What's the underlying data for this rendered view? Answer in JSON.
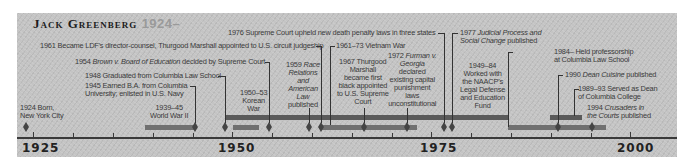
{
  "title": {
    "name": "Jack Greenberg",
    "years": "1924–"
  },
  "axis": {
    "labels": [
      "1925",
      "1950",
      "1975",
      "2000"
    ]
  },
  "events": [
    {
      "id": "born",
      "text": [
        "1924 Born,",
        "New York City"
      ]
    },
    {
      "id": "ww2",
      "text": [
        "1939–45",
        "World War II"
      ]
    },
    {
      "id": "ba",
      "text": [
        "1945 Earned B.A. from Columbia",
        "University; enlisted in U.S. Navy"
      ]
    },
    {
      "id": "law",
      "text": "1948 Graduated from Columbia Law School"
    },
    {
      "id": "korea",
      "text": [
        "1950–53",
        "Korean",
        "War"
      ]
    },
    {
      "id": "brown",
      "text": {
        "year": "1954",
        "case": "Brown v. Board of Education",
        "rest": "decided by Supreme Court"
      }
    },
    {
      "id": "race",
      "text": [
        "1959",
        "Race",
        "Relations",
        "and",
        "American",
        "Law",
        "published"
      ]
    },
    {
      "id": "director",
      "text": "1961 Became LDF's director-counsel, Thurgood Marshall appointed to U.S. circuit judgeship"
    },
    {
      "id": "vietnam",
      "text": "1961–73 Vietnam War"
    },
    {
      "id": "marshall",
      "text": [
        "1967 Thurgood",
        "Marshall",
        "became first",
        "black appointed",
        "to U.S. Supreme",
        "Court"
      ]
    },
    {
      "id": "furman",
      "text": {
        "year": "1972",
        "case": "Furman v.",
        "case2": "Georgia",
        "rest": [
          "declared",
          "existing capital",
          "punishment",
          "laws",
          "unconstitutional"
        ]
      }
    },
    {
      "id": "gregg",
      "text": "1976 Supreme Court upheld new death penalty laws in three states"
    },
    {
      "id": "judicial",
      "text": {
        "year": "1977",
        "title1": "Judicial Process and",
        "title2": "Social Change",
        "rest": "published"
      }
    },
    {
      "id": "naacp",
      "text": [
        "1949–84",
        "Worked with",
        "the NAACP's",
        "Legal Defense",
        "and Education",
        "Fund"
      ]
    },
    {
      "id": "prof",
      "text": [
        "1984– Held professorship",
        "at Columbia Law School"
      ]
    },
    {
      "id": "cuisine",
      "text": {
        "year": "1990",
        "title": "Dean Cuisine",
        "rest": "published"
      }
    },
    {
      "id": "dean",
      "text": [
        "1989–93 Served as Dean",
        "of Columbia College"
      ]
    },
    {
      "id": "crusaders",
      "text": {
        "year": "1994",
        "title1": "Crusaders in",
        "title2": "the Courts",
        "rest": "published"
      }
    }
  ],
  "colors": {
    "panel": "#c4c4c4",
    "bar_dark": "#5a5a5a",
    "bar_mid": "#707070",
    "text": "#3a3a3a",
    "title_year": "#9a9a9a"
  }
}
